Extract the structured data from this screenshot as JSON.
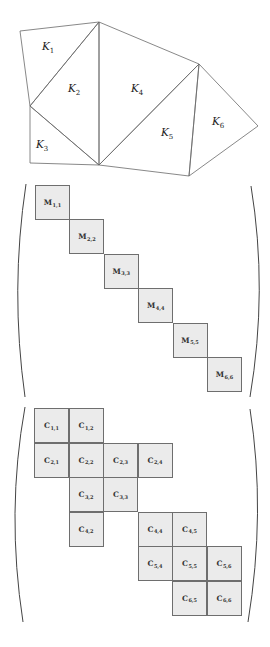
{
  "mesh": {
    "vertices": {
      "A": [
        20,
        31
      ],
      "B": [
        99,
        22
      ],
      "C": [
        30,
        106
      ],
      "D": [
        30,
        163
      ],
      "E": [
        99,
        165
      ],
      "F": [
        199,
        64
      ],
      "G": [
        258,
        126
      ],
      "H": [
        189,
        176
      ]
    },
    "elements": [
      {
        "name": "K",
        "sub": "1",
        "x": 42,
        "y": 50
      },
      {
        "name": "K",
        "sub": "2",
        "x": 68,
        "y": 92
      },
      {
        "name": "K",
        "sub": "3",
        "x": 36,
        "y": 148
      },
      {
        "name": "K",
        "sub": "4",
        "x": 131,
        "y": 92
      },
      {
        "name": "K",
        "sub": "5",
        "x": 161,
        "y": 136
      },
      {
        "name": "K",
        "sub": "6",
        "x": 212,
        "y": 125
      }
    ]
  },
  "mass_matrix": {
    "symbol": "M",
    "label": "block-diagonal",
    "cells": [
      {
        "row": 1,
        "col": 1,
        "sub": "1,1"
      },
      {
        "row": 2,
        "col": 2,
        "sub": "2,2"
      },
      {
        "row": 3,
        "col": 3,
        "sub": "3,3"
      },
      {
        "row": 4,
        "col": 4,
        "sub": "4,4"
      },
      {
        "row": 5,
        "col": 5,
        "sub": "5,5"
      },
      {
        "row": 6,
        "col": 6,
        "sub": "6,6"
      }
    ]
  },
  "coupling_matrix": {
    "symbol": "C",
    "label": "block-sparse",
    "cells": [
      {
        "row": 1,
        "col": 1,
        "sub": "1,1"
      },
      {
        "row": 1,
        "col": 2,
        "sub": "1,2"
      },
      {
        "row": 2,
        "col": 1,
        "sub": "2,1"
      },
      {
        "row": 2,
        "col": 2,
        "sub": "2,2"
      },
      {
        "row": 2,
        "col": 3,
        "sub": "2,3"
      },
      {
        "row": 2,
        "col": 4,
        "sub": "2,4"
      },
      {
        "row": 3,
        "col": 2,
        "sub": "3,2"
      },
      {
        "row": 3,
        "col": 3,
        "sub": "3,3"
      },
      {
        "row": 4,
        "col": 2,
        "sub": "4,2"
      },
      {
        "row": 4,
        "col": 4,
        "sub": "4,4"
      },
      {
        "row": 4,
        "col": 5,
        "sub": "4,5"
      },
      {
        "row": 5,
        "col": 4,
        "sub": "5,4"
      },
      {
        "row": 5,
        "col": 5,
        "sub": "5,5"
      },
      {
        "row": 5,
        "col": 6,
        "sub": "5,6"
      },
      {
        "row": 6,
        "col": 5,
        "sub": "6,5"
      },
      {
        "row": 6,
        "col": 6,
        "sub": "6,6"
      }
    ]
  },
  "colors": {
    "cell_fill": "#ebebeb",
    "cell_border": "#6e6e6e",
    "edge": "#6a6a6a"
  }
}
